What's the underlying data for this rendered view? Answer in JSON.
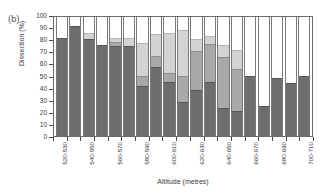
{
  "figure": {
    "panel_label": "(b)"
  },
  "chart_data": {
    "type": "bar",
    "title": "",
    "xlabel": "Altitude (metres)",
    "ylabel": "Dissection (%)",
    "ylim": [
      0,
      100
    ],
    "ytick_values": [
      0,
      10,
      20,
      30,
      40,
      50,
      60,
      70,
      80,
      90,
      100
    ],
    "ytick_labels": [
      "0",
      "10",
      "20",
      "30",
      "40",
      "50",
      "60",
      "70",
      "80",
      "90",
      "100"
    ],
    "grid": false,
    "legend": "none",
    "stacked": true,
    "bar_count": 19,
    "categories": [
      "520-530",
      "530-540",
      "540-550",
      "550-560",
      "560-570",
      "570-580",
      "580-590",
      "590-600",
      "600-610",
      "610-620",
      "620-630",
      "630-640",
      "640-650",
      "650-660",
      "660-670",
      "670-680",
      "680-690",
      "690-700",
      "700-710"
    ],
    "xtick_labels_shown": [
      "520-530",
      "540-550",
      "560-570",
      "580-590",
      "600-610",
      "620-630",
      "640-650",
      "660-670",
      "680-690",
      "700-710"
    ],
    "xtick_label_indices": [
      0,
      2,
      4,
      6,
      8,
      10,
      12,
      14,
      16,
      18
    ],
    "series": [
      {
        "name": "dark",
        "color": "#6e6e6e",
        "values": [
          81,
          91,
          80,
          75,
          74,
          74,
          41,
          57,
          45,
          28,
          38,
          45,
          23,
          21,
          50,
          25,
          48,
          44,
          50
        ]
      },
      {
        "name": "medium",
        "color": "#a9a9a9",
        "values": [
          0,
          0,
          0,
          0,
          4,
          0,
          9,
          9,
          7,
          22,
          32,
          31,
          42,
          34,
          0,
          0,
          0,
          0,
          0
        ]
      },
      {
        "name": "light",
        "color": "#d3d3d3",
        "values": [
          0,
          0,
          5,
          0,
          3,
          7,
          27,
          18,
          33,
          38,
          10,
          7,
          10,
          16,
          0,
          0,
          0,
          0,
          0
        ]
      }
    ],
    "cumulative_tops": [
      [
        81,
        81,
        81
      ],
      [
        91,
        91,
        91
      ],
      [
        80,
        80,
        85
      ],
      [
        75,
        75,
        75
      ],
      [
        74,
        78,
        81
      ],
      [
        74,
        74,
        81
      ],
      [
        41,
        50,
        77
      ],
      [
        57,
        66,
        84
      ],
      [
        45,
        52,
        85
      ],
      [
        28,
        50,
        88
      ],
      [
        38,
        70,
        80
      ],
      [
        45,
        76,
        83
      ],
      [
        23,
        65,
        75
      ],
      [
        21,
        55,
        71
      ],
      [
        50,
        50,
        50
      ],
      [
        25,
        25,
        25
      ],
      [
        48,
        48,
        48
      ],
      [
        44,
        44,
        44
      ],
      [
        50,
        50,
        50
      ]
    ]
  }
}
